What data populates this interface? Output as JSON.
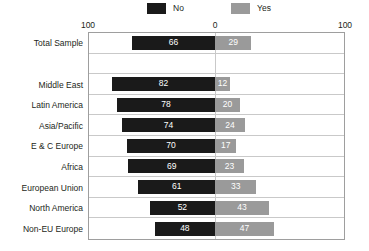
{
  "legend": {
    "items": [
      {
        "label": "No",
        "color": "#1a1a1a",
        "icon": "legend-swatch-no-icon"
      },
      {
        "label": "Yes",
        "color": "#9a9a9a",
        "icon": "legend-swatch-yes-icon"
      }
    ]
  },
  "axis": {
    "tick_left": "100",
    "tick_center": "0",
    "tick_right": "100"
  },
  "chart_data": {
    "type": "bar",
    "orientation": "horizontal",
    "layout": "diverging",
    "title": "",
    "subtitle": "",
    "xlabel": "",
    "ylabel": "",
    "xlim": [
      -100,
      100
    ],
    "xticks": [
      100,
      0,
      100
    ],
    "grid": true,
    "legend_position": "top",
    "legend": [
      "No",
      "Yes"
    ],
    "colors": {
      "No": "#1a1a1a",
      "Yes": "#9a9a9a"
    },
    "categories": [
      "Total Sample",
      "Middle East",
      "Latin America",
      "Asia/Pacific",
      "E & C Europe",
      "Africa",
      "European Union",
      "North America",
      "Non-EU Europe"
    ],
    "series": [
      {
        "name": "No",
        "values": [
          66,
          82,
          78,
          74,
          70,
          69,
          61,
          52,
          48
        ]
      },
      {
        "name": "Yes",
        "values": [
          29,
          12,
          20,
          24,
          17,
          23,
          33,
          43,
          47
        ]
      }
    ],
    "rows": [
      {
        "category": "Total Sample",
        "no": 66,
        "yes": 29
      },
      {
        "category": "Middle East",
        "no": 82,
        "yes": 12
      },
      {
        "category": "Latin America",
        "no": 78,
        "yes": 20
      },
      {
        "category": "Asia/Pacific",
        "no": 74,
        "yes": 24
      },
      {
        "category": "E & C Europe",
        "no": 70,
        "yes": 17
      },
      {
        "category": "Africa",
        "no": 69,
        "yes": 23
      },
      {
        "category": "European Union",
        "no": 61,
        "yes": 33
      },
      {
        "category": "North America",
        "no": 52,
        "yes": 43
      },
      {
        "category": "Non-EU Europe",
        "no": 48,
        "yes": 47
      }
    ]
  }
}
